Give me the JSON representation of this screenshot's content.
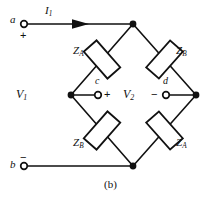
{
  "figure": {
    "caption": "(b)",
    "type": "bridge-circuit-schematic",
    "line_color": "#111111",
    "background_color": "#ffffff"
  },
  "terminals": [
    {
      "id": "a",
      "label": "a",
      "polarity": "+",
      "position": "top-left"
    },
    {
      "id": "b",
      "label": "b",
      "polarity": "−",
      "position": "bottom-left"
    }
  ],
  "nodes": [
    {
      "id": "c",
      "label": "c",
      "polarity": "+",
      "position": "center-left"
    },
    {
      "id": "d",
      "label": "d",
      "polarity": "−",
      "position": "center-right"
    }
  ],
  "currents": [
    {
      "symbol": "I",
      "subscript": "1",
      "direction": "right"
    }
  ],
  "voltages": [
    {
      "symbol": "V",
      "subscript": "1",
      "position": "left"
    },
    {
      "symbol": "V",
      "subscript": "2",
      "position": "center"
    }
  ],
  "impedances": [
    {
      "symbol": "Z",
      "subscript": "A",
      "arm": "upper-left"
    },
    {
      "symbol": "Z",
      "subscript": "B",
      "arm": "upper-right"
    },
    {
      "symbol": "Z",
      "subscript": "B",
      "arm": "lower-left"
    },
    {
      "symbol": "Z",
      "subscript": "A",
      "arm": "lower-right"
    }
  ]
}
